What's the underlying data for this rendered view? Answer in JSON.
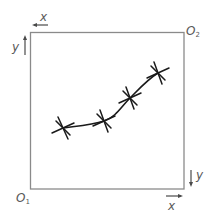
{
  "diagram": {
    "type": "coordinate-frame-with-curve",
    "frame": {
      "left": 30,
      "top": 32,
      "right": 184,
      "bottom": 189,
      "stroke": "#8a8a8a"
    },
    "origins": {
      "o1": {
        "label": "O",
        "sub": "1",
        "position": "bottom-left"
      },
      "o2": {
        "label": "O",
        "sub": "2",
        "position": "top-right"
      }
    },
    "axes": {
      "top_left_x": {
        "label": "x",
        "direction": "left"
      },
      "top_left_y": {
        "label": "y",
        "direction": "up"
      },
      "bottom_right_x": {
        "label": "x",
        "direction": "right"
      },
      "bottom_right_y": {
        "label": "y",
        "direction": "down"
      }
    },
    "curve": {
      "stroke": "#1a1a1a",
      "points": [
        {
          "x": 63,
          "y": 128
        },
        {
          "x": 104,
          "y": 121
        },
        {
          "x": 130,
          "y": 98
        },
        {
          "x": 158,
          "y": 73
        }
      ]
    },
    "markers": {
      "shape": "asterisk",
      "count": 4
    },
    "colors": {
      "frame": "#8a8a8a",
      "labels": "#5a5a5a",
      "curve": "#1a1a1a"
    }
  }
}
